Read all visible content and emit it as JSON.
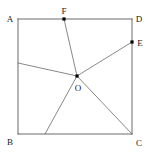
{
  "figure": {
    "background_color": "#ffffff",
    "line_color": "#5a5a5a",
    "ray_color": "#6a6a6a",
    "label_color": "#1a1a1a",
    "dot_color": "#000000",
    "width": 152,
    "height": 156,
    "points": {
      "A": {
        "label": "A",
        "x": 18,
        "y": 19,
        "label_x": 10,
        "label_y": 22,
        "has_dot": false
      },
      "B": {
        "label": "B",
        "x": 18,
        "y": 134,
        "label_x": 10,
        "label_y": 145,
        "has_dot": false
      },
      "C": {
        "label": "C",
        "x": 132,
        "y": 134,
        "label_x": 139,
        "label_y": 146,
        "has_dot": false
      },
      "D": {
        "label": "D",
        "x": 132,
        "y": 19,
        "label_x": 139,
        "label_y": 22,
        "has_dot": false
      },
      "E": {
        "label": "E",
        "x": 132,
        "y": 42,
        "label_x": 140,
        "label_y": 46,
        "has_dot": true
      },
      "F": {
        "label": "F",
        "x": 64,
        "y": 19,
        "label_x": 64,
        "label_y": 14,
        "has_dot": true
      },
      "O": {
        "label": "O",
        "x": 77,
        "y": 76,
        "label_x": 78,
        "label_y": 91,
        "has_dot": true
      },
      "P": {
        "label": "",
        "x": 18,
        "y": 63,
        "label_x": 0,
        "label_y": 0,
        "has_dot": false
      },
      "Q": {
        "label": "",
        "x": 45,
        "y": 134,
        "label_x": 0,
        "label_y": 0,
        "has_dot": false
      }
    },
    "square_edges": [
      {
        "name": "edge-AD",
        "from": "A",
        "to": "D"
      },
      {
        "name": "edge-DC",
        "from": "D",
        "to": "C"
      },
      {
        "name": "edge-CB",
        "from": "C",
        "to": "B"
      },
      {
        "name": "edge-BA",
        "from": "B",
        "to": "A"
      }
    ],
    "rays": [
      {
        "name": "segment-OF",
        "from": "O",
        "to": "F"
      },
      {
        "name": "segment-OE",
        "from": "O",
        "to": "E"
      },
      {
        "name": "segment-OC",
        "from": "O",
        "to": "C"
      },
      {
        "name": "segment-OP",
        "from": "O",
        "to": "P"
      },
      {
        "name": "segment-OQ",
        "from": "O",
        "to": "Q"
      }
    ],
    "labels": [
      "A",
      "B",
      "C",
      "D",
      "E",
      "F",
      "O"
    ],
    "dots": [
      "E",
      "F",
      "O"
    ]
  }
}
